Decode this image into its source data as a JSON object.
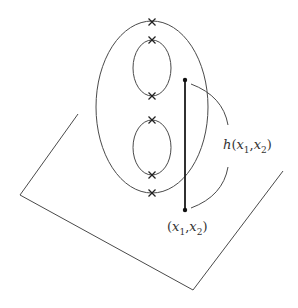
{
  "diagram": {
    "plane": {
      "points": [
        [
          78,
          114
        ],
        [
          20,
          195
        ],
        [
          193,
          290
        ],
        [
          283,
          171
        ]
      ]
    },
    "outer_ellipse": {
      "cx": 152,
      "cy": 107,
      "rx": 56,
      "ry": 86
    },
    "inner_ellipses": [
      {
        "cx": 152,
        "cy": 68,
        "rx": 19,
        "ry": 28
      },
      {
        "cx": 152,
        "cy": 147.5,
        "rx": 19,
        "ry": 27.5
      }
    ],
    "marked_points": [
      {
        "x": 152,
        "y": 22
      },
      {
        "x": 152,
        "y": 40
      },
      {
        "x": 152,
        "y": 96
      },
      {
        "x": 152,
        "y": 120
      },
      {
        "x": 152,
        "y": 175
      },
      {
        "x": 152,
        "y": 193
      }
    ],
    "vertical_segment": {
      "x": 185,
      "y1": 80,
      "y2": 210
    },
    "brace": {
      "upper_arc": {
        "from": [
          191,
          84
        ],
        "to": [
          228,
          125
        ]
      },
      "lower_arc": {
        "from": [
          228,
          167
        ],
        "to": [
          191,
          208
        ]
      }
    },
    "labels": {
      "height": {
        "func": "h",
        "open": "(",
        "var1": "x",
        "sub1": "1",
        "sep": ",",
        "var2": "x",
        "sub2": "2",
        "close": ")"
      },
      "point": {
        "open": "(",
        "var1": "x",
        "sub1": "1",
        "sep": ",",
        "var2": "x",
        "sub2": "2",
        "close": ")"
      }
    }
  }
}
